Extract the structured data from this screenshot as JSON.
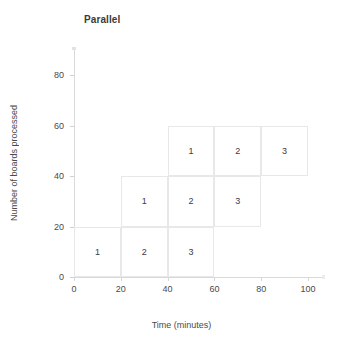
{
  "chart_data": {
    "type": "bar",
    "title": "Parallel",
    "xlabel": "Time (minutes)",
    "ylabel": "Number of boards processed",
    "xlim": [
      0,
      100
    ],
    "ylim": [
      0,
      80
    ],
    "xticks": [
      "0",
      "20",
      "40",
      "60",
      "80",
      "100"
    ],
    "xtick_values": [
      0,
      20,
      40,
      60,
      80,
      100
    ],
    "yticks": [
      "0",
      "20",
      "40",
      "60",
      "80"
    ],
    "ytick_values": [
      0,
      20,
      40,
      60,
      80
    ],
    "grid": false,
    "legend": "none",
    "cells": [
      {
        "label": "1",
        "x0": 0,
        "x1": 20,
        "y0": 0,
        "y1": 20
      },
      {
        "label": "2",
        "x0": 20,
        "x1": 40,
        "y0": 0,
        "y1": 20
      },
      {
        "label": "3",
        "x0": 40,
        "x1": 60,
        "y0": 0,
        "y1": 20
      },
      {
        "label": "1",
        "x0": 20,
        "x1": 40,
        "y0": 20,
        "y1": 40
      },
      {
        "label": "2",
        "x0": 40,
        "x1": 60,
        "y0": 20,
        "y1": 40
      },
      {
        "label": "3",
        "x0": 60,
        "x1": 80,
        "y0": 20,
        "y1": 40
      },
      {
        "label": "1",
        "x0": 40,
        "x1": 60,
        "y0": 40,
        "y1": 60
      },
      {
        "label": "2",
        "x0": 60,
        "x1": 80,
        "y0": 40,
        "y1": 60
      },
      {
        "label": "3",
        "x0": 80,
        "x1": 100,
        "y0": 40,
        "y1": 60
      }
    ],
    "series": [
      {
        "name": "Board 1",
        "start_times": [
          0,
          20,
          40
        ],
        "end_times": [
          20,
          40,
          60
        ],
        "levels": [
          20,
          40,
          60
        ]
      },
      {
        "name": "Board 2",
        "start_times": [
          20,
          40,
          60
        ],
        "end_times": [
          40,
          60,
          80
        ],
        "levels": [
          20,
          40,
          60
        ]
      },
      {
        "name": "Board 3",
        "start_times": [
          40,
          60,
          80
        ],
        "end_times": [
          60,
          80,
          100
        ],
        "levels": [
          20,
          40,
          60
        ]
      }
    ],
    "colors": {
      "cell_border": "#e8e8e8",
      "cell_fill": "#ffffff",
      "axis": "#d9d9d9",
      "text": "#4a4a4a",
      "title_text": "#3a3a3a"
    }
  }
}
